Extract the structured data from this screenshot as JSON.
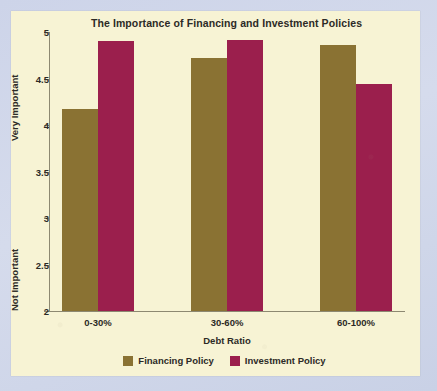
{
  "chart_data": {
    "type": "bar",
    "title": "The Importance of Financing and Investment Policies",
    "xlabel": "Debt Ratio",
    "ylabel": "",
    "categories": [
      "0-30%",
      "30-60%",
      "60-100%"
    ],
    "series": [
      {
        "name": "Financing Policy",
        "color": "#8a7233",
        "values": [
          4.17,
          4.72,
          4.86
        ]
      },
      {
        "name": "Investment Policy",
        "color": "#9b1f4d",
        "values": [
          4.9,
          4.91,
          4.44
        ]
      }
    ],
    "ylim": [
      2,
      5
    ],
    "ytick_values": [
      5,
      4.5,
      4,
      3.5,
      3,
      2.5,
      2
    ],
    "ytick_labels": [
      "5",
      "4.5",
      "4",
      "3.5",
      "3",
      "2.5",
      "2"
    ],
    "y_axis_top_caption": "Very Important",
    "y_axis_bottom_caption": "Not Important",
    "grid": false,
    "legend_position": "bottom",
    "legend_entries": [
      "Financing Policy",
      "Investment Policy"
    ],
    "panel_background": "#f7f3d4",
    "page_background": "#ccd3e8",
    "axis_color": "#8d8871",
    "text_color": "#2c2a26"
  }
}
